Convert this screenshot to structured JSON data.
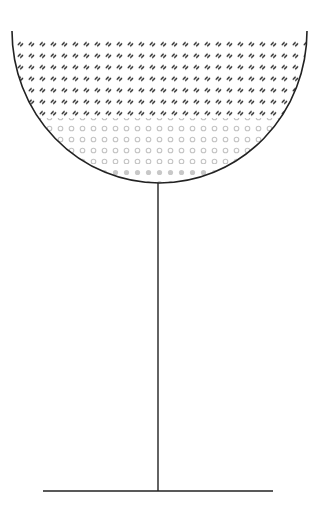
{
  "diagram": {
    "colors": {
      "background": "#ffffff",
      "outline": "#222222",
      "top_layer_glyph": "#2a2a2a",
      "bottom_layer_ring": "#c4c4c4",
      "bottom_layer_dot": "#c8c8c8"
    },
    "bowl": {
      "center_x": 159.5,
      "top_y": 31,
      "radius_x": 147.5,
      "radius_y": 152
    },
    "layers": [
      {
        "name": "top-liquid-layer",
        "pattern": "dark-slash-pairs",
        "from_y": 36,
        "to_y": 116
      },
      {
        "name": "bottom-liquid-layer",
        "pattern": "grey-rings-and-dots",
        "from_y": 118,
        "to_y": 183
      }
    ],
    "stem": {
      "x": 158,
      "top_y": 183,
      "bottom_y": 491
    },
    "base": {
      "x1": 43,
      "x2": 273,
      "y": 491
    }
  }
}
